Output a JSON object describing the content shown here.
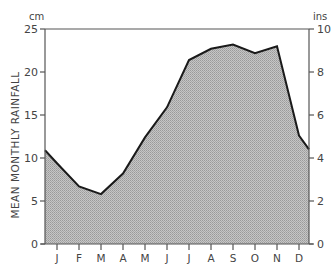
{
  "chart_data": {
    "type": "area",
    "title": "",
    "ylabel": "MEAN MONTHLY RAINFALL",
    "xlabel": "",
    "left_axis": {
      "unit": "cm",
      "ticks": [
        0,
        5,
        10,
        15,
        20,
        25
      ],
      "range": [
        0,
        25
      ]
    },
    "right_axis": {
      "unit": "ins",
      "ticks": [
        0,
        2,
        4,
        6,
        8,
        10
      ],
      "range": [
        0,
        10
      ]
    },
    "categories": [
      "J",
      "F",
      "M",
      "A",
      "M",
      "J",
      "J",
      "A",
      "S",
      "O",
      "N",
      "D"
    ],
    "series": [
      {
        "name": "Mean monthly rainfall (cm)",
        "values": [
          9.4,
          6.7,
          5.8,
          8.2,
          12.4,
          15.9,
          21.4,
          22.7,
          23.2,
          22.2,
          23.0,
          12.6
        ]
      }
    ],
    "edge_values": {
      "start": 10.9,
      "end": 11.0
    },
    "grid": false,
    "legend": "none",
    "fill_color": "#b9b9b9",
    "line_color": "#1a1a1a"
  }
}
